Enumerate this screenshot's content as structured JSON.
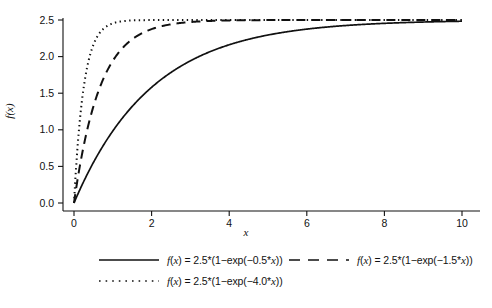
{
  "chart_data": {
    "type": "line",
    "title": "",
    "xlabel": "x",
    "ylabel": "f(x)",
    "xlim": [
      0,
      10
    ],
    "ylim": [
      0,
      2.5
    ],
    "xticks": [
      0,
      2,
      4,
      6,
      8,
      10
    ],
    "xticklabels": [
      "0",
      "2",
      "4",
      "6",
      "8",
      "10"
    ],
    "yticks": [
      0.0,
      0.5,
      1.0,
      1.5,
      2.0,
      2.5
    ],
    "yticklabels": [
      "0.0",
      "0.5",
      "1.0",
      "1.5",
      "2.0",
      "2.5"
    ],
    "grid": false,
    "legend_position": "below",
    "background_color": "#ffffff",
    "line_color": "#111111",
    "formula": "f(x) = 2.5*(1-exp(-k*x))",
    "amplitude": 2.5,
    "series": [
      {
        "name": "f(x) = 2.5*(1−exp(−0.5*x))",
        "label_prefix": "f",
        "label_rest": "(x) = 2.5*(1−exp(−0.5*x))",
        "rate": 0.5,
        "linestyle": "solid",
        "swatch": "solid-line-swatch",
        "x": [
          0,
          0.25,
          0.5,
          0.75,
          1,
          1.5,
          2,
          2.5,
          3,
          3.5,
          4,
          4.5,
          5,
          5.5,
          6,
          6.5,
          7,
          7.5,
          8,
          8.5,
          9,
          9.5,
          10
        ],
        "y": [
          0.0,
          0.294,
          0.552,
          0.779,
          0.976,
          1.319,
          1.58,
          1.784,
          1.942,
          2.065,
          2.162,
          2.236,
          2.295,
          2.34,
          2.376,
          2.403,
          2.424,
          2.441,
          2.454,
          2.464,
          2.472,
          2.478,
          2.483
        ]
      },
      {
        "name": "f(x) = 2.5*(1−exp(−1.5*x))",
        "label_prefix": "f",
        "label_rest": "(x) = 2.5*(1−exp(−1.5*x))",
        "rate": 1.5,
        "linestyle": "dashed",
        "swatch": "dashed-line-swatch",
        "x": [
          0,
          0.25,
          0.5,
          0.75,
          1,
          1.5,
          2,
          2.5,
          3,
          3.5,
          4,
          4.5,
          5,
          6,
          7,
          8,
          9,
          10
        ],
        "y": [
          0.0,
          0.781,
          1.319,
          1.688,
          1.942,
          2.236,
          2.376,
          2.441,
          2.472,
          2.487,
          2.494,
          2.497,
          2.499,
          2.5,
          2.5,
          2.5,
          2.5,
          2.5
        ]
      },
      {
        "name": "f(x) = 2.5*(1−exp(−4.0*x))",
        "label_prefix": "f",
        "label_rest": "(x) = 2.5*(1−exp(−4.0*x))",
        "rate": 4.0,
        "linestyle": "dotted",
        "swatch": "dotted-line-swatch",
        "x": [
          0,
          0.1,
          0.2,
          0.3,
          0.4,
          0.5,
          0.75,
          1,
          1.25,
          1.5,
          2,
          2.5,
          3,
          4,
          5,
          6,
          7,
          8,
          9,
          10
        ],
        "y": [
          0.0,
          0.824,
          1.377,
          1.747,
          1.995,
          2.162,
          2.376,
          2.454,
          2.483,
          2.494,
          2.499,
          2.5,
          2.5,
          2.5,
          2.5,
          2.5,
          2.5,
          2.5,
          2.5,
          2.5
        ]
      }
    ]
  },
  "legend": {
    "entries": [
      {
        "text": "f(x) = 2.5*(1−exp(−0.5*x))",
        "style": "solid"
      },
      {
        "text": "f(x) = 2.5*(1−exp(−1.5*x))",
        "style": "dashed"
      },
      {
        "text": "f(x) = 2.5*(1−exp(−4.0*x))",
        "style": "dotted"
      }
    ]
  }
}
